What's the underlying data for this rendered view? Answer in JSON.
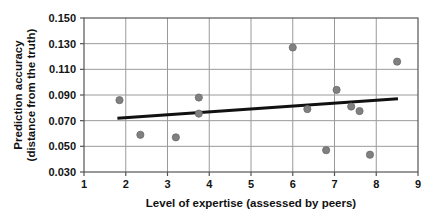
{
  "chart_data": {
    "type": "scatter",
    "title": "",
    "subtitle": "",
    "xlabel": "Level of expertise (assessed by peers)",
    "ylabel_line1": "Prediction accuracy",
    "ylabel_line2": "(distance from the truth)",
    "xlim": [
      1,
      9
    ],
    "ylim": [
      0.03,
      0.15
    ],
    "xticks": [
      1,
      2,
      3,
      4,
      5,
      6,
      7,
      8,
      9
    ],
    "xtick_labels": [
      "1",
      "2",
      "3",
      "4",
      "5",
      "6",
      "7",
      "8",
      "9"
    ],
    "yticks": [
      0.03,
      0.05,
      0.07,
      0.09,
      0.11,
      0.13,
      0.15
    ],
    "ytick_labels": [
      "0.030",
      "0.050",
      "0.070",
      "0.090",
      "0.110",
      "0.130",
      "0.150"
    ],
    "grid": true,
    "grid_color": "#9a9a9a",
    "axis_color": "#555555",
    "legend": null,
    "legend_position": "none",
    "marker_color": "#808080",
    "marker_edge_color": "#6a6a6a",
    "marker_size": 6,
    "points": [
      {
        "x": 1.85,
        "y": 0.086
      },
      {
        "x": 2.35,
        "y": 0.059
      },
      {
        "x": 3.2,
        "y": 0.057
      },
      {
        "x": 3.75,
        "y": 0.088
      },
      {
        "x": 3.75,
        "y": 0.0755
      },
      {
        "x": 6.0,
        "y": 0.127
      },
      {
        "x": 6.35,
        "y": 0.079
      },
      {
        "x": 6.8,
        "y": 0.047
      },
      {
        "x": 7.05,
        "y": 0.094
      },
      {
        "x": 7.4,
        "y": 0.081
      },
      {
        "x": 7.6,
        "y": 0.0775
      },
      {
        "x": 7.85,
        "y": 0.0435
      },
      {
        "x": 8.5,
        "y": 0.116
      }
    ],
    "trendline": {
      "type": "linear-fit",
      "color": "#111111",
      "width": 3,
      "x_start": 1.8,
      "y_start": 0.0718,
      "x_end": 8.52,
      "y_end": 0.087
    }
  }
}
